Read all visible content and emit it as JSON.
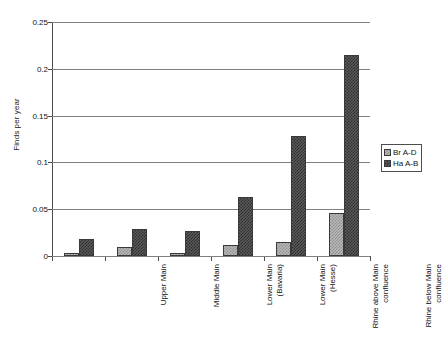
{
  "chart_data": {
    "type": "bar",
    "title": "",
    "xlabel": "",
    "ylabel": "Finds per year",
    "ylim": [
      0,
      0.25
    ],
    "yticks": [
      "0",
      "0.05",
      "0.1",
      "0.15",
      "0.2",
      "0.25"
    ],
    "ytick_values": [
      0,
      0.05,
      0.1,
      0.15,
      0.2,
      0.25
    ],
    "grid": true,
    "legend_position": "right",
    "categories": [
      "Upper Main",
      "Middle Main",
      "Lower Main\n(Bavaria)",
      "Lower Main\n(Hesse)",
      "Rhine above Main\nconfluence",
      "Rhine below Main\nconfluence"
    ],
    "series": [
      {
        "name": "Br A-D",
        "color": "#b8b8b8",
        "values": [
          0.003,
          0.01,
          0.003,
          0.012,
          0.015,
          0.046
        ]
      },
      {
        "name": "Ha A-B",
        "color": "#5a5a5a",
        "values": [
          0.018,
          0.029,
          0.027,
          0.063,
          0.128,
          0.215
        ]
      }
    ]
  }
}
